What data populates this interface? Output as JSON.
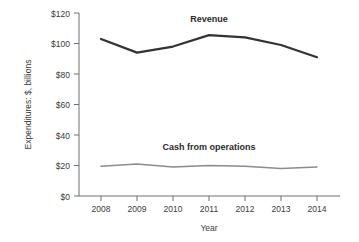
{
  "chart_data": {
    "type": "line",
    "title": "",
    "xlabel": "Year",
    "ylabel": "Expenditures: $, billions",
    "x": [
      2008,
      2009,
      2010,
      2011,
      2012,
      2013,
      2014
    ],
    "xtick_labels": [
      "2008",
      "2009",
      "2010",
      "2011",
      "2012",
      "2013",
      "2014"
    ],
    "ytick_labels": [
      "$0",
      "$20",
      "$40",
      "$60",
      "$80",
      "$100",
      "$120"
    ],
    "ytick_values": [
      0,
      20,
      40,
      60,
      80,
      100,
      120
    ],
    "ylim": [
      0,
      120
    ],
    "xlim": [
      2008,
      2014
    ],
    "grid": false,
    "legend_position": "inline-annotations",
    "series": [
      {
        "name": "Revenue",
        "label": "Revenue",
        "color": "#333333",
        "line_width": 2.2,
        "values": [
          103,
          94,
          98,
          105.5,
          104,
          99,
          91
        ],
        "label_x": 2011,
        "label_y": 114
      },
      {
        "name": "Cash from operations",
        "label": "Cash from operations",
        "color": "#8c8c8c",
        "line_width": 1.5,
        "values": [
          19.5,
          21,
          19,
          20,
          19.5,
          18,
          19
        ],
        "label_x": 2011,
        "label_y": 30
      }
    ],
    "colors": {
      "revenue": "#333333",
      "cash": "#8c8c8c",
      "axis": "#6e6e6e",
      "text": "#3a3a3a",
      "background": "#ffffff"
    }
  }
}
